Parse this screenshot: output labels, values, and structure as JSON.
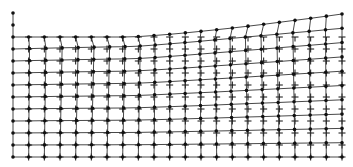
{
  "figure": {
    "colors": {
      "background": "#ffffff",
      "ink": "#111111",
      "mesh_line": "#333333"
    },
    "reference_grid": {
      "marker": "plus",
      "top_row_marker": "tee",
      "x_start": 13,
      "x_end": 342,
      "columns": 22,
      "y_start": 37,
      "y_end": 157,
      "rows": 11
    },
    "deformed_mesh": {
      "node_marker": "dot",
      "top_left_y": 37,
      "top_right_y": 14,
      "left_column_extra_nodes_y": [
        13,
        25
      ],
      "max_uplift_px": 23,
      "uplift_decay": "decreases linearly to zero at bottom boundary"
    }
  }
}
